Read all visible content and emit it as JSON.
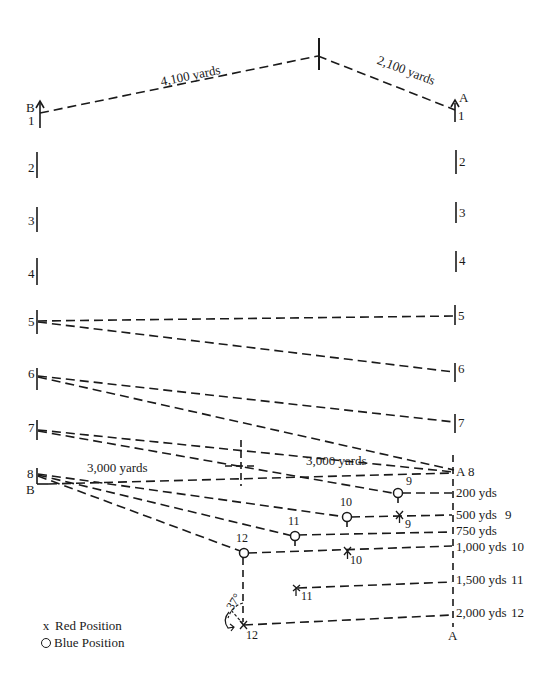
{
  "diagram": {
    "title_labels": {
      "leg_b": "4,100 yards",
      "leg_a": "2,100 yards",
      "range_left": "3,000 yards",
      "range_right": "3,000 yards",
      "angle": "37°"
    },
    "ship_labels": {
      "b": "B",
      "a": "A"
    },
    "left_positions": [
      "1",
      "2",
      "3",
      "4",
      "5",
      "6",
      "7",
      "8"
    ],
    "right_positions": [
      "1",
      "2",
      "3",
      "4",
      "5",
      "6",
      "7",
      "8"
    ],
    "range_markers": [
      {
        "label": "200 yds",
        "index": ""
      },
      {
        "label": "500 yds",
        "index": "9"
      },
      {
        "label": "750 yds",
        "index": ""
      },
      {
        "label": "1,000 yds",
        "index": "10"
      },
      {
        "label": "1,500 yds",
        "index": "11"
      },
      {
        "label": "2,000 yds",
        "index": "12"
      }
    ],
    "blue_points": [
      {
        "label": "9"
      },
      {
        "label": "10"
      },
      {
        "label": "11"
      },
      {
        "label": "12"
      }
    ],
    "red_points": [
      {
        "label": "9"
      },
      {
        "label": "10"
      },
      {
        "label": "11"
      },
      {
        "label": "12"
      }
    ],
    "a8_label": "A 8",
    "bottom_a_label": "A"
  },
  "legend": {
    "red": {
      "symbol": "x",
      "label": "Red Position"
    },
    "blue": {
      "symbol": "circle",
      "label": "Blue Position"
    }
  }
}
